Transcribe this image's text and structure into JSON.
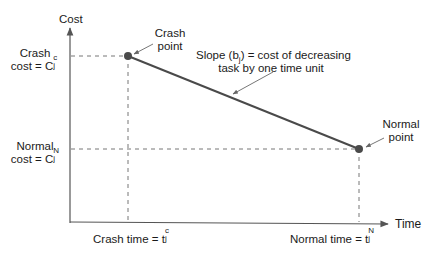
{
  "diagram": {
    "type": "time-cost tradeoff",
    "colors": {
      "axis": "#555555",
      "cost_line": "#4a4a4a",
      "points": "#4a4a4a",
      "dashed_guides": "#777777",
      "callout_arrows": "#666666",
      "text": "#1a1a1a"
    },
    "axes": {
      "y_label": "Cost",
      "x_label": "Time"
    },
    "points": [
      {
        "id": "crash",
        "label_line1": "Crash",
        "label_line2": "point",
        "x_px": 128,
        "y_px": 56
      },
      {
        "id": "normal",
        "label_line1": "Normal",
        "label_line2": "point",
        "x_px": 359,
        "y_px": 149
      }
    ],
    "y_annotations": {
      "crash_cost": {
        "line1": "Crash",
        "line2_prefix": "cost = C",
        "sup": "c",
        "sub": "j"
      },
      "normal_cost": {
        "line1": "Normal",
        "line2_prefix": "cost = C",
        "sup": "N",
        "sub": "j"
      }
    },
    "x_annotations": {
      "crash_time": {
        "prefix": "Crash time = t",
        "sup": "c",
        "sub": "j"
      },
      "normal_time": {
        "prefix": "Normal time = t",
        "sup": "N",
        "sub": "j"
      }
    },
    "slope_note": {
      "line1_prefix": "Slope (b",
      "line1_sub": "j",
      "line1_suffix": ") = cost of decreasing",
      "line2": "task by one time unit"
    }
  }
}
